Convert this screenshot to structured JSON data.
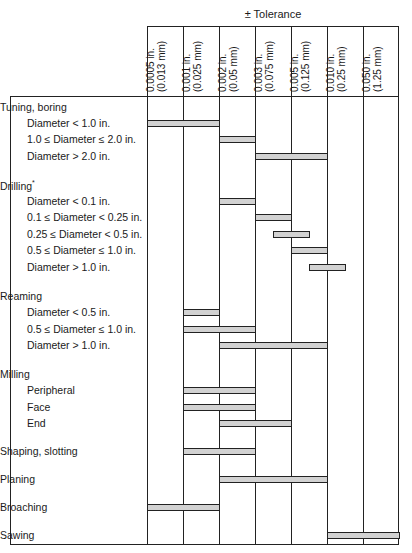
{
  "chart_data": {
    "type": "table",
    "title": "± Tolerance",
    "columns": [
      {
        "in": "0.0005 in.",
        "mm": "(0.013 mm)"
      },
      {
        "in": "0.001 in.",
        "mm": "(0.025 mm)"
      },
      {
        "in": "0.002 in.",
        "mm": "(0.05 mm)"
      },
      {
        "in": "0.003 in.",
        "mm": "(0.075 mm)"
      },
      {
        "in": "0.005 in.",
        "mm": "(0.125 mm)"
      },
      {
        "in": "0.010 in.",
        "mm": "(0.25 mm)"
      },
      {
        "in": "0.050 in.",
        "mm": "(1.25 mm)"
      }
    ],
    "rows": [
      {
        "label": "Tuning, boring",
        "type": "group",
        "y": 108
      },
      {
        "label": "Diameter < 1.0 in.",
        "type": "sub",
        "y": 124,
        "bar": [
          0,
          2
        ]
      },
      {
        "label": "1.0 ≤ Diameter ≤ 2.0 in.",
        "type": "sub",
        "y": 140,
        "bar": [
          2,
          3
        ]
      },
      {
        "label": "Diameter > 2.0 in.",
        "type": "sub",
        "y": 157,
        "bar": [
          3,
          5
        ]
      },
      {
        "label": "Drilling",
        "sup": "*",
        "type": "group",
        "y": 186
      },
      {
        "label": "Diameter < 0.1 in.",
        "type": "sub",
        "y": 202,
        "bar": [
          2,
          3
        ]
      },
      {
        "label": "0.1 ≤ Diameter < 0.25 in.",
        "type": "sub",
        "y": 218,
        "bar": [
          3,
          4
        ]
      },
      {
        "label": "0.25 ≤ Diameter < 0.5 in.",
        "type": "sub",
        "y": 235,
        "bar": [
          3.5,
          4.5
        ]
      },
      {
        "label": "0.5 ≤ Diameter ≤ 1.0 in.",
        "type": "sub",
        "y": 251,
        "bar": [
          4,
          5
        ]
      },
      {
        "label": "Diameter > 1.0 in.",
        "type": "sub",
        "y": 268,
        "bar": [
          4.5,
          5.5
        ]
      },
      {
        "label": "Reaming",
        "type": "group",
        "y": 297
      },
      {
        "label": "Diameter < 0.5 in.",
        "type": "sub",
        "y": 313,
        "bar": [
          1,
          2
        ]
      },
      {
        "label": "0.5 ≤ Diameter ≤ 1.0 in.",
        "type": "sub",
        "y": 330,
        "bar": [
          1,
          3
        ]
      },
      {
        "label": "Diameter > 1.0 in.",
        "type": "sub",
        "y": 346,
        "bar": [
          2,
          5
        ]
      },
      {
        "label": "Milling",
        "type": "group",
        "y": 375
      },
      {
        "label": "Peripheral",
        "type": "sub",
        "y": 391,
        "bar": [
          1,
          3
        ]
      },
      {
        "label": "Face",
        "type": "sub",
        "y": 408,
        "bar": [
          1,
          3
        ]
      },
      {
        "label": "End",
        "type": "sub",
        "y": 424,
        "bar": [
          2,
          4
        ]
      },
      {
        "label": "Shaping, slotting",
        "type": "group",
        "y": 452,
        "bar": [
          1,
          3
        ]
      },
      {
        "label": "Planing",
        "type": "group",
        "y": 480,
        "bar": [
          2,
          5
        ]
      },
      {
        "label": "Broaching",
        "type": "group",
        "y": 508,
        "bar": [
          0,
          2
        ]
      },
      {
        "label": "Sawing",
        "type": "group",
        "y": 536,
        "bar": [
          5,
          7
        ]
      }
    ]
  }
}
